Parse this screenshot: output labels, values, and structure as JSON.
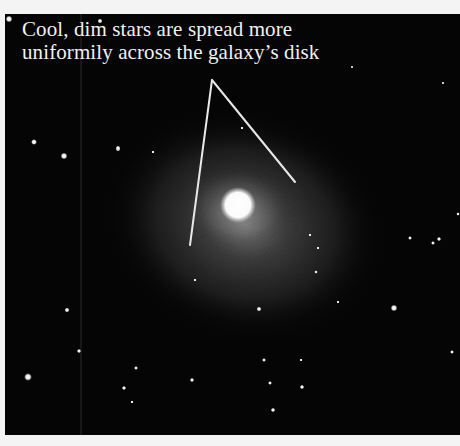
{
  "figure": {
    "annotation": {
      "line1": "Cool, dim stars are spread more",
      "line2": "uniformily across the galaxy’s disk"
    },
    "colors": {
      "background": "#050505",
      "frame": "#f4f4f4",
      "text": "#f2f2f2",
      "pointer_line": "#e8e8e8"
    }
  }
}
